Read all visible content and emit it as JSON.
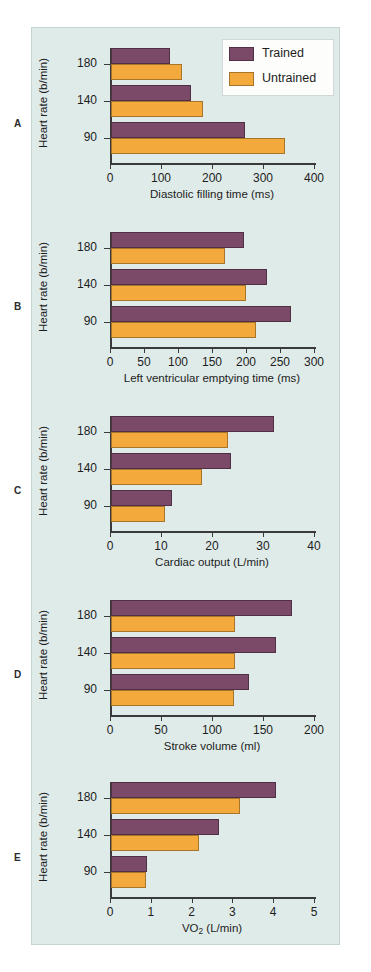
{
  "figure": {
    "background_color": "#dfebe9",
    "trained_color": "#7b4a68",
    "untrained_color": "#f4a93c",
    "y_axis_label": "Heart rate (b/min)",
    "y_categories": [
      "180",
      "140",
      "90"
    ]
  },
  "legend": {
    "position": "top-right",
    "entries": [
      {
        "label": "Trained",
        "color": "#7b4a68"
      },
      {
        "label": "Untrained",
        "color": "#f4a93c"
      }
    ]
  },
  "panels": [
    {
      "letter": "A"
    },
    {
      "letter": "B"
    },
    {
      "letter": "C"
    },
    {
      "letter": "D"
    },
    {
      "letter": "E"
    }
  ],
  "chart_data": [
    {
      "type": "bar",
      "panel": "A",
      "orientation": "horizontal",
      "title": "",
      "xlabel": "Diastolic filling time (ms)",
      "ylabel": "Heart rate (b/min)",
      "categories": [
        "180",
        "140",
        "90"
      ],
      "xlim": [
        0,
        400
      ],
      "xticks": [
        0,
        100,
        200,
        300,
        400
      ],
      "xtick_labels": [
        "0",
        "100",
        "200",
        "300",
        "400"
      ],
      "grid": false,
      "legend": "top-right",
      "series": [
        {
          "name": "Trained",
          "color": "#7b4a68",
          "values": [
            116,
            156,
            262
          ]
        },
        {
          "name": "Untrained",
          "color": "#f4a93c",
          "values": [
            139,
            181,
            341
          ]
        }
      ]
    },
    {
      "type": "bar",
      "panel": "B",
      "orientation": "horizontal",
      "title": "",
      "xlabel": "Left ventricular emptying time (ms)",
      "ylabel": "Heart rate (b/min)",
      "categories": [
        "180",
        "140",
        "90"
      ],
      "xlim": [
        0,
        300
      ],
      "xticks": [
        0,
        50,
        100,
        150,
        200,
        250,
        300
      ],
      "xtick_labels": [
        "0",
        "50",
        "100",
        "150",
        "200",
        "250",
        "300"
      ],
      "grid": false,
      "series": [
        {
          "name": "Trained",
          "color": "#7b4a68",
          "values": [
            195,
            230,
            265
          ]
        },
        {
          "name": "Untrained",
          "color": "#f4a93c",
          "values": [
            167,
            198,
            213
          ]
        }
      ]
    },
    {
      "type": "bar",
      "panel": "C",
      "orientation": "horizontal",
      "title": "",
      "xlabel": "Cardiac output (L/min)",
      "ylabel": "Heart rate (b/min)",
      "categories": [
        "180",
        "140",
        "90"
      ],
      "xlim": [
        0,
        40
      ],
      "xticks": [
        0,
        10,
        20,
        30,
        40
      ],
      "xtick_labels": [
        "0",
        "10",
        "20",
        "30",
        "40"
      ],
      "grid": false,
      "series": [
        {
          "name": "Trained",
          "color": "#7b4a68",
          "values": [
            32.0,
            23.5,
            12.0
          ]
        },
        {
          "name": "Untrained",
          "color": "#f4a93c",
          "values": [
            23.0,
            17.8,
            10.5
          ]
        }
      ]
    },
    {
      "type": "bar",
      "panel": "D",
      "orientation": "horizontal",
      "title": "",
      "xlabel": "Stroke volume (ml)",
      "ylabel": "Heart rate (b/min)",
      "categories": [
        "180",
        "140",
        "90"
      ],
      "xlim": [
        0,
        200
      ],
      "xticks": [
        0,
        50,
        100,
        150,
        200
      ],
      "xtick_labels": [
        "0",
        "50",
        "100",
        "150",
        "200"
      ],
      "grid": false,
      "series": [
        {
          "name": "Trained",
          "color": "#7b4a68",
          "values": [
            177,
            162,
            135
          ]
        },
        {
          "name": "Untrained",
          "color": "#f4a93c",
          "values": [
            122,
            122,
            121
          ]
        }
      ]
    },
    {
      "type": "bar",
      "panel": "E",
      "orientation": "horizontal",
      "title": "",
      "xlabel": "VO2 (L/min)",
      "xlabel_html": "VO<sub>2</sub> (L/min)",
      "ylabel": "Heart rate (b/min)",
      "categories": [
        "180",
        "140",
        "90"
      ],
      "xlim": [
        0,
        5
      ],
      "xticks": [
        0,
        1,
        2,
        3,
        4,
        5
      ],
      "xtick_labels": [
        "0",
        "1",
        "2",
        "3",
        "4",
        "5"
      ],
      "grid": false,
      "series": [
        {
          "name": "Trained",
          "color": "#7b4a68",
          "values": [
            4.05,
            2.65,
            0.88
          ]
        },
        {
          "name": "Untrained",
          "color": "#f4a93c",
          "values": [
            3.15,
            2.15,
            0.87
          ]
        }
      ]
    }
  ]
}
